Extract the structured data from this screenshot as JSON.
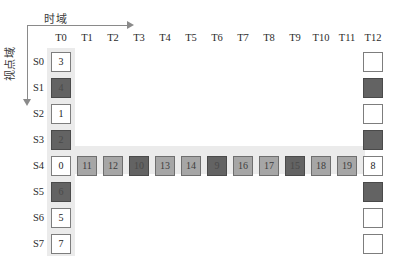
{
  "axes": {
    "time_label": "时域",
    "view_label": "视点域"
  },
  "columns": [
    "T0",
    "T1",
    "T2",
    "T3",
    "T4",
    "T5",
    "T6",
    "T7",
    "T8",
    "T9",
    "T10",
    "T11",
    "T12"
  ],
  "rows": [
    "S0",
    "S1",
    "S2",
    "S3",
    "S4",
    "S5",
    "S6",
    "S7"
  ],
  "colors": {
    "light_cell": "#ffffff",
    "mid_cell": "#a6a6a6",
    "dark_cell": "#636363",
    "band": "#ebebeb",
    "border": "#7d7d7d",
    "axis": "#8a8a8a"
  },
  "caption": "",
  "chart_data": {
    "type": "table",
    "title": "",
    "xlabel": "时域",
    "ylabel": "视点域",
    "categories": [
      "T0",
      "T1",
      "T2",
      "T3",
      "T4",
      "T5",
      "T6",
      "T7",
      "T8",
      "T9",
      "T10",
      "T11",
      "T12"
    ],
    "row_categories": [
      "S0",
      "S1",
      "S2",
      "S3",
      "S4",
      "S5",
      "S6",
      "S7"
    ],
    "grid": false,
    "legend": "none",
    "note": "Hierarchical B-frame prediction structure grid: column T0 and row S4 are highlighted bands; shade encodes frame type (light=I/key, mid=P, dark=B).",
    "cells": [
      {
        "row": "S0",
        "col": "T0",
        "value": "3",
        "shade": "light"
      },
      {
        "row": "S0",
        "col": "T12",
        "value": "",
        "shade": "empty"
      },
      {
        "row": "S1",
        "col": "T0",
        "value": "4",
        "shade": "dark"
      },
      {
        "row": "S1",
        "col": "T12",
        "value": "",
        "shade": "dark"
      },
      {
        "row": "S2",
        "col": "T0",
        "value": "1",
        "shade": "light"
      },
      {
        "row": "S2",
        "col": "T12",
        "value": "",
        "shade": "empty"
      },
      {
        "row": "S3",
        "col": "T0",
        "value": "2",
        "shade": "dark"
      },
      {
        "row": "S3",
        "col": "T12",
        "value": "",
        "shade": "dark"
      },
      {
        "row": "S4",
        "col": "T0",
        "value": "0",
        "shade": "light"
      },
      {
        "row": "S4",
        "col": "T1",
        "value": "11",
        "shade": "mid"
      },
      {
        "row": "S4",
        "col": "T2",
        "value": "12",
        "shade": "mid"
      },
      {
        "row": "S4",
        "col": "T3",
        "value": "10",
        "shade": "dark"
      },
      {
        "row": "S4",
        "col": "T4",
        "value": "13",
        "shade": "mid"
      },
      {
        "row": "S4",
        "col": "T5",
        "value": "14",
        "shade": "mid"
      },
      {
        "row": "S4",
        "col": "T6",
        "value": "9",
        "shade": "dark"
      },
      {
        "row": "S4",
        "col": "T7",
        "value": "16",
        "shade": "mid"
      },
      {
        "row": "S4",
        "col": "T8",
        "value": "17",
        "shade": "mid"
      },
      {
        "row": "S4",
        "col": "T9",
        "value": "15",
        "shade": "dark"
      },
      {
        "row": "S4",
        "col": "T10",
        "value": "18",
        "shade": "mid"
      },
      {
        "row": "S4",
        "col": "T11",
        "value": "19",
        "shade": "mid"
      },
      {
        "row": "S4",
        "col": "T12",
        "value": "8",
        "shade": "light"
      },
      {
        "row": "S5",
        "col": "T0",
        "value": "6",
        "shade": "dark"
      },
      {
        "row": "S5",
        "col": "T12",
        "value": "",
        "shade": "dark"
      },
      {
        "row": "S6",
        "col": "T0",
        "value": "5",
        "shade": "light"
      },
      {
        "row": "S6",
        "col": "T12",
        "value": "",
        "shade": "empty"
      },
      {
        "row": "S7",
        "col": "T0",
        "value": "7",
        "shade": "light"
      },
      {
        "row": "S7",
        "col": "T12",
        "value": "",
        "shade": "empty"
      }
    ]
  }
}
